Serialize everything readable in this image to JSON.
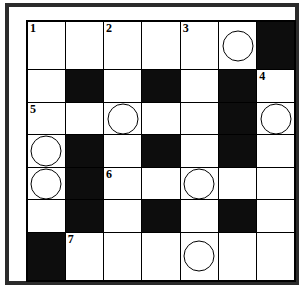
{
  "puzzle": {
    "kind": "crossword-grid",
    "rows": 7,
    "columns": 7,
    "colors": {
      "block": "#0d0d0d",
      "open": "#ffffff",
      "grid_line": "#000000",
      "frame": "#2b2b2b"
    },
    "legend": {
      "block_label": "blocked square",
      "open_label": "open square",
      "circle_label": "circled square"
    },
    "clue_numbers": [
      "1",
      "2",
      "3",
      "4",
      "5",
      "6",
      "7"
    ],
    "cells": [
      [
        {
          "block": false,
          "number": "1",
          "circle": false
        },
        {
          "block": false,
          "number": "",
          "circle": false
        },
        {
          "block": false,
          "number": "2",
          "circle": false
        },
        {
          "block": false,
          "number": "",
          "circle": false
        },
        {
          "block": false,
          "number": "3",
          "circle": false
        },
        {
          "block": false,
          "number": "",
          "circle": true
        },
        {
          "block": true,
          "number": "",
          "circle": false
        }
      ],
      [
        {
          "block": false,
          "number": "",
          "circle": false
        },
        {
          "block": true,
          "number": "",
          "circle": false
        },
        {
          "block": false,
          "number": "",
          "circle": false
        },
        {
          "block": true,
          "number": "",
          "circle": false
        },
        {
          "block": false,
          "number": "",
          "circle": false
        },
        {
          "block": true,
          "number": "",
          "circle": false
        },
        {
          "block": false,
          "number": "4",
          "circle": false
        }
      ],
      [
        {
          "block": false,
          "number": "5",
          "circle": false
        },
        {
          "block": false,
          "number": "",
          "circle": false
        },
        {
          "block": false,
          "number": "",
          "circle": true
        },
        {
          "block": false,
          "number": "",
          "circle": false
        },
        {
          "block": false,
          "number": "",
          "circle": false
        },
        {
          "block": true,
          "number": "",
          "circle": false
        },
        {
          "block": false,
          "number": "",
          "circle": true
        }
      ],
      [
        {
          "block": false,
          "number": "",
          "circle": true
        },
        {
          "block": true,
          "number": "",
          "circle": false
        },
        {
          "block": false,
          "number": "",
          "circle": false
        },
        {
          "block": true,
          "number": "",
          "circle": false
        },
        {
          "block": false,
          "number": "",
          "circle": false
        },
        {
          "block": true,
          "number": "",
          "circle": false
        },
        {
          "block": false,
          "number": "",
          "circle": false
        }
      ],
      [
        {
          "block": false,
          "number": "",
          "circle": true
        },
        {
          "block": true,
          "number": "",
          "circle": false
        },
        {
          "block": false,
          "number": "6",
          "circle": false
        },
        {
          "block": false,
          "number": "",
          "circle": false
        },
        {
          "block": false,
          "number": "",
          "circle": true
        },
        {
          "block": false,
          "number": "",
          "circle": false
        },
        {
          "block": false,
          "number": "",
          "circle": false
        }
      ],
      [
        {
          "block": false,
          "number": "",
          "circle": false
        },
        {
          "block": true,
          "number": "",
          "circle": false
        },
        {
          "block": false,
          "number": "",
          "circle": false
        },
        {
          "block": true,
          "number": "",
          "circle": false
        },
        {
          "block": false,
          "number": "",
          "circle": false
        },
        {
          "block": true,
          "number": "",
          "circle": false
        },
        {
          "block": false,
          "number": "",
          "circle": false
        }
      ],
      [
        {
          "block": true,
          "number": "",
          "circle": false
        },
        {
          "block": false,
          "number": "7",
          "circle": false
        },
        {
          "block": false,
          "number": "",
          "circle": false
        },
        {
          "block": false,
          "number": "",
          "circle": false
        },
        {
          "block": false,
          "number": "",
          "circle": true
        },
        {
          "block": false,
          "number": "",
          "circle": false
        },
        {
          "block": false,
          "number": "",
          "circle": false
        }
      ]
    ]
  }
}
